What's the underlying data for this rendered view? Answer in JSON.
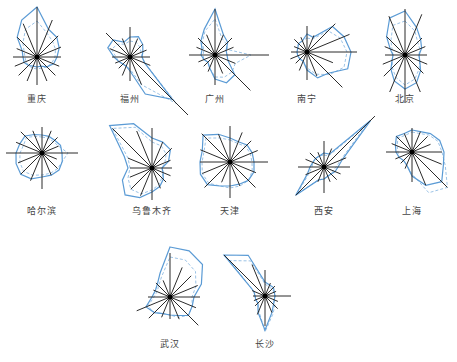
{
  "chart_data": {
    "type": "radar",
    "subtype": "wind-rose small multiples",
    "title": "",
    "directions": [
      "N",
      "NNE",
      "NE",
      "ENE",
      "E",
      "ESE",
      "SE",
      "SSE",
      "S",
      "SSW",
      "SW",
      "WSW",
      "W",
      "WNW",
      "NW",
      "NNW"
    ],
    "legend": [],
    "series_styles": {
      "spokes": {
        "color": "#2b2b2b",
        "width": 1
      },
      "solid": {
        "color": "#5b9bd5",
        "width": 1.2,
        "dash": ""
      },
      "dashed": {
        "color": "#9cc3e6",
        "width": 1,
        "dash": "3,2"
      }
    },
    "charts": [
      {
        "city": "重庆",
        "cx": 37,
        "cy": 57,
        "label_y": 98,
        "spokes": [
          50,
          40,
          30,
          26,
          24,
          24,
          26,
          26,
          28,
          26,
          26,
          24,
          24,
          22,
          28,
          36
        ],
        "solid": [
          50,
          30,
          28,
          24,
          20,
          18,
          14,
          10,
          10,
          10,
          12,
          14,
          14,
          16,
          28,
          40
        ],
        "dashed": [
          36,
          26,
          22,
          20,
          18,
          16,
          14,
          12,
          12,
          12,
          12,
          12,
          12,
          14,
          20,
          30
        ]
      },
      {
        "city": "福州",
        "cx": 130,
        "cy": 57,
        "label_y": 98,
        "spokes": [
          30,
          20,
          18,
          18,
          20,
          22,
          82,
          30,
          24,
          20,
          16,
          16,
          18,
          22,
          34,
          20
        ],
        "solid": [
          20,
          22,
          18,
          14,
          12,
          16,
          60,
          40,
          14,
          10,
          10,
          12,
          16,
          24,
          24,
          16
        ],
        "dashed": [
          16,
          16,
          14,
          12,
          12,
          16,
          66,
          30,
          12,
          10,
          10,
          12,
          14,
          20,
          18,
          14
        ]
      },
      {
        "city": "广州",
        "cx": 215,
        "cy": 55,
        "label_y": 98,
        "spokes": [
          46,
          22,
          24,
          20,
          54,
          22,
          50,
          20,
          30,
          18,
          16,
          18,
          26,
          20,
          24,
          22
        ],
        "solid": [
          46,
          22,
          18,
          12,
          12,
          14,
          28,
          30,
          24,
          14,
          10,
          12,
          14,
          14,
          20,
          28
        ],
        "dashed": [
          36,
          18,
          16,
          14,
          36,
          22,
          24,
          24,
          22,
          14,
          10,
          12,
          12,
          12,
          18,
          26
        ]
      },
      {
        "city": "南宁",
        "cx": 307,
        "cy": 52,
        "label_y": 98,
        "spokes": [
          26,
          18,
          40,
          46,
          50,
          28,
          50,
          26,
          28,
          20,
          16,
          18,
          16,
          14,
          18,
          16
        ],
        "solid": [
          18,
          16,
          36,
          40,
          44,
          44,
          30,
          28,
          18,
          10,
          10,
          10,
          10,
          10,
          12,
          12
        ],
        "dashed": [
          14,
          14,
          30,
          36,
          40,
          40,
          32,
          24,
          16,
          10,
          10,
          10,
          10,
          10,
          12,
          12
        ]
      },
      {
        "city": "北京",
        "cx": 405,
        "cy": 55,
        "label_y": 98,
        "spokes": [
          46,
          44,
          24,
          22,
          22,
          24,
          26,
          40,
          48,
          40,
          30,
          24,
          20,
          22,
          26,
          42
        ],
        "solid": [
          44,
          30,
          22,
          18,
          14,
          16,
          22,
          30,
          34,
          28,
          20,
          14,
          12,
          16,
          26,
          40
        ],
        "dashed": [
          34,
          26,
          18,
          16,
          14,
          16,
          20,
          26,
          30,
          24,
          18,
          14,
          12,
          14,
          20,
          32
        ]
      },
      {
        "city": "哈尔滨",
        "cx": 42,
        "cy": 153,
        "label_y": 210,
        "spokes": [
          26,
          24,
          22,
          18,
          36,
          16,
          22,
          24,
          36,
          30,
          30,
          26,
          36,
          28,
          30,
          24
        ],
        "solid": [
          18,
          18,
          18,
          20,
          20,
          22,
          24,
          24,
          24,
          28,
          30,
          28,
          26,
          24,
          24,
          20
        ],
        "dashed": [
          16,
          16,
          16,
          18,
          26,
          22,
          22,
          22,
          22,
          24,
          26,
          24,
          22,
          20,
          22,
          18
        ]
      },
      {
        "city": "乌鲁木齐",
        "cx": 152,
        "cy": 168,
        "label_y": 210,
        "spokes": [
          40,
          28,
          28,
          20,
          20,
          20,
          20,
          22,
          32,
          30,
          30,
          24,
          22,
          26,
          56,
          40
        ],
        "solid": [
          30,
          28,
          26,
          18,
          10,
          12,
          16,
          20,
          24,
          32,
          38,
          32,
          24,
          30,
          60,
          48
        ],
        "dashed": [
          26,
          24,
          20,
          14,
          10,
          12,
          14,
          18,
          22,
          28,
          30,
          26,
          22,
          26,
          56,
          44
        ]
      },
      {
        "city": "天津",
        "cx": 230,
        "cy": 162,
        "label_y": 210,
        "spokes": [
          36,
          32,
          30,
          30,
          38,
          28,
          36,
          26,
          36,
          22,
          36,
          30,
          30,
          32,
          40,
          30
        ],
        "solid": [
          24,
          22,
          24,
          24,
          24,
          26,
          26,
          24,
          24,
          26,
          32,
          32,
          30,
          30,
          38,
          30
        ],
        "dashed": [
          22,
          20,
          22,
          22,
          22,
          24,
          26,
          26,
          26,
          26,
          30,
          30,
          28,
          28,
          34,
          26
        ]
      },
      {
        "city": "西安",
        "cx": 324,
        "cy": 167,
        "label_y": 210,
        "spokes": [
          26,
          20,
          72,
          24,
          26,
          18,
          18,
          16,
          26,
          16,
          40,
          20,
          26,
          20,
          20,
          16
        ],
        "solid": [
          14,
          14,
          66,
          20,
          14,
          12,
          10,
          10,
          12,
          14,
          40,
          18,
          14,
          12,
          12,
          12
        ],
        "dashed": [
          12,
          12,
          60,
          18,
          12,
          10,
          10,
          10,
          12,
          14,
          38,
          16,
          12,
          12,
          12,
          12
        ]
      },
      {
        "city": "上海",
        "cx": 412,
        "cy": 152,
        "label_y": 210,
        "spokes": [
          24,
          22,
          22,
          20,
          30,
          32,
          50,
          36,
          30,
          18,
          16,
          18,
          26,
          22,
          22,
          20
        ],
        "solid": [
          22,
          22,
          26,
          30,
          32,
          34,
          42,
          36,
          24,
          14,
          12,
          14,
          16,
          18,
          22,
          20
        ],
        "dashed": [
          20,
          20,
          24,
          28,
          30,
          36,
          50,
          44,
          22,
          14,
          12,
          14,
          14,
          16,
          20,
          18
        ]
      },
      {
        "city": "武汉",
        "cx": 170,
        "cy": 297,
        "label_y": 343,
        "spokes": [
          44,
          32,
          30,
          30,
          30,
          28,
          40,
          24,
          22,
          22,
          30,
          36,
          22,
          18,
          20,
          18
        ],
        "solid": [
          50,
          50,
          46,
          34,
          24,
          24,
          26,
          20,
          18,
          18,
          22,
          26,
          18,
          16,
          18,
          26
        ],
        "dashed": [
          40,
          40,
          36,
          28,
          22,
          24,
          26,
          22,
          18,
          18,
          22,
          24,
          16,
          14,
          16,
          22
        ]
      },
      {
        "city": "长沙",
        "cx": 265,
        "cy": 296,
        "label_y": 343,
        "spokes": [
          26,
          14,
          14,
          12,
          26,
          14,
          18,
          18,
          30,
          20,
          14,
          12,
          12,
          14,
          58,
          34
        ],
        "solid": [
          14,
          12,
          12,
          10,
          10,
          10,
          12,
          18,
          34,
          18,
          10,
          10,
          10,
          12,
          58,
          44
        ],
        "dashed": [
          12,
          10,
          10,
          10,
          10,
          10,
          14,
          20,
          36,
          16,
          10,
          10,
          10,
          12,
          50,
          38
        ]
      }
    ]
  }
}
